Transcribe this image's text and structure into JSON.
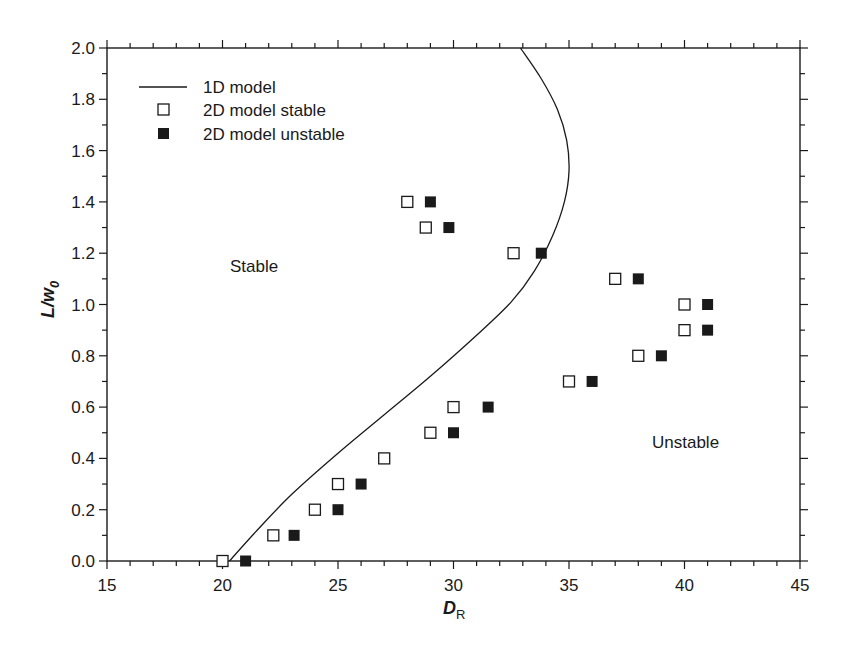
{
  "chart_data": {
    "type": "scatter",
    "title": "",
    "xlabel": "D_R",
    "xlabel_main": "D",
    "xlabel_sub": "R",
    "ylabel": "L/w_0",
    "ylabel_main": "L/w",
    "ylabel_sub": "0",
    "xlim": [
      15,
      45
    ],
    "ylim": [
      0,
      2.0
    ],
    "x_ticks": [
      15,
      20,
      25,
      30,
      35,
      40,
      45
    ],
    "x_tick_labels": [
      "15",
      "20",
      "25",
      "30",
      "35",
      "40",
      "45"
    ],
    "y_ticks": [
      0,
      0.2,
      0.4,
      0.6,
      0.8,
      1.0,
      1.2,
      1.4,
      1.6,
      1.8,
      2.0
    ],
    "y_tick_labels": [
      "0.0",
      "0.2",
      "0.4",
      "0.6",
      "0.8",
      "1.0",
      "1.2",
      "1.4",
      "1.6",
      "1.8",
      "2.0"
    ],
    "grid": false,
    "legend_position": "upper left",
    "legend": [
      {
        "label": "1D model",
        "marker": "line"
      },
      {
        "label": "2D model stable",
        "marker": "open-square"
      },
      {
        "label": "2D model unstable",
        "marker": "filled-square"
      }
    ],
    "annotations": [
      {
        "text": "Stable",
        "x": 24.5,
        "y": 1.15
      },
      {
        "text": "Unstable",
        "x": 39.0,
        "y": 0.45
      }
    ],
    "series": [
      {
        "name": "1D model",
        "type": "line",
        "x": [
          20.3,
          21.5,
          23.0,
          25.0,
          27.0,
          29.0,
          31.0,
          32.5,
          33.5,
          34.3,
          34.8,
          35.0,
          34.9,
          34.5,
          33.8,
          32.9
        ],
        "y": [
          0.0,
          0.12,
          0.26,
          0.42,
          0.57,
          0.72,
          0.88,
          1.01,
          1.13,
          1.27,
          1.4,
          1.52,
          1.64,
          1.76,
          1.88,
          2.0
        ]
      },
      {
        "name": "2D model stable",
        "type": "scatter",
        "marker": "open-square",
        "x": [
          20.0,
          22.2,
          24.0,
          25.0,
          27.0,
          29.0,
          30.0,
          35.0,
          38.0,
          40.0,
          40.0,
          37.0,
          32.6,
          28.8,
          28.0
        ],
        "y": [
          0.0,
          0.1,
          0.2,
          0.3,
          0.4,
          0.5,
          0.6,
          0.7,
          0.8,
          0.9,
          1.0,
          1.1,
          1.2,
          1.3,
          1.4
        ]
      },
      {
        "name": "2D model unstable",
        "type": "scatter",
        "marker": "filled-square",
        "x": [
          21.0,
          23.1,
          25.0,
          26.0,
          30.0,
          31.5,
          36.0,
          39.0,
          41.0,
          41.0,
          38.0,
          33.8,
          29.8,
          29.0
        ],
        "y": [
          0.0,
          0.1,
          0.2,
          0.3,
          0.5,
          0.6,
          0.7,
          0.8,
          0.9,
          1.0,
          1.1,
          1.2,
          1.3,
          1.4
        ]
      }
    ]
  },
  "colors": {
    "ink": "#1a1a1a",
    "background": "#ffffff"
  }
}
